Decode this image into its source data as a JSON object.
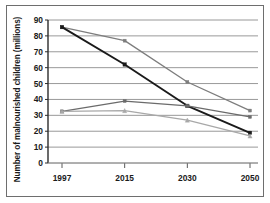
{
  "chart_data": {
    "type": "line",
    "title": "",
    "xlabel": "",
    "ylabel": "Number of malnourished children (millions)",
    "categories": [
      "1997",
      "2015",
      "2030",
      "2050"
    ],
    "x": [
      1997,
      2015,
      2030,
      2050
    ],
    "ylim": [
      0,
      90
    ],
    "ytick_step": 10,
    "yticks": [
      "0",
      "10",
      "20",
      "30",
      "40",
      "50",
      "60",
      "70",
      "80",
      "90"
    ],
    "grid": true,
    "legend": "none",
    "series": [
      {
        "name": "series-1",
        "color": "#7d7d7d",
        "marker": "square",
        "values": [
          85.5,
          77,
          51,
          33
        ]
      },
      {
        "name": "series-2",
        "color": "#1a1a1a",
        "marker": "square",
        "values": [
          85.5,
          62,
          36,
          19
        ]
      },
      {
        "name": "series-3",
        "color": "#6b6b6b",
        "marker": "square",
        "values": [
          32.5,
          39,
          36,
          29
        ]
      },
      {
        "name": "series-4",
        "color": "#a8a8a8",
        "marker": "triangle",
        "values": [
          32.5,
          33,
          27,
          17
        ]
      }
    ]
  }
}
